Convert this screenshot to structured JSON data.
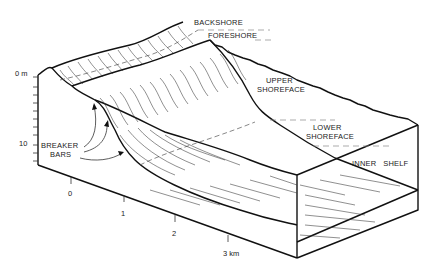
{
  "diagram": {
    "type": "block-diagram",
    "zone_labels": {
      "backshore": "BACKSHORE",
      "foreshore": "FORESHORE",
      "upper_shoreface_1": "UPPER",
      "upper_shoreface_2": "SHOREFACE",
      "lower_shoreface_1": "LOWER",
      "lower_shoreface_2": "SHOREFACE",
      "inner_shelf": "INNER   SHELF"
    },
    "feature_labels": {
      "breaker_1": "BREAKER",
      "breaker_2": "BARS"
    },
    "depth_axis": {
      "top_label": "0 m",
      "mark_label": "10"
    },
    "distance_axis": {
      "ticks": [
        "0",
        "1",
        "2",
        "3 km"
      ]
    }
  }
}
